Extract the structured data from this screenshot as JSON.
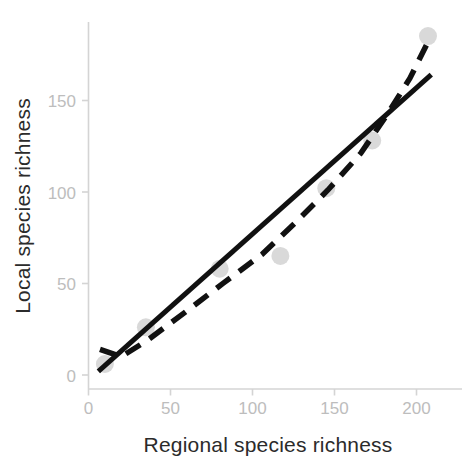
{
  "chart_data": {
    "type": "scatter",
    "title": "",
    "subtitle": "",
    "xlabel": "Regional species richness",
    "ylabel": "Local species richness",
    "xlim": [
      -4,
      222
    ],
    "ylim": [
      -8,
      198
    ],
    "xticks": [
      0,
      50,
      100,
      150,
      200
    ],
    "xtick_labels": [
      "0",
      "50",
      "100",
      "150",
      "200"
    ],
    "yticks": [
      0,
      50,
      100,
      150
    ],
    "ytick_labels": [
      "0",
      "50",
      "100",
      "150"
    ],
    "grid": false,
    "legend": null,
    "points": [
      {
        "x": 10,
        "y": 6
      },
      {
        "x": 35,
        "y": 26
      },
      {
        "x": 80,
        "y": 58
      },
      {
        "x": 117,
        "y": 65
      },
      {
        "x": 145,
        "y": 102
      },
      {
        "x": 173,
        "y": 128
      },
      {
        "x": 207,
        "y": 185
      }
    ],
    "marker": {
      "shape": "circle",
      "color": "#d9d9d9",
      "size_px": 18
    },
    "series": [
      {
        "name": "linear-fit",
        "style": "solid",
        "color": "#111111",
        "points": [
          {
            "x": 6,
            "y": 2
          },
          {
            "x": 209,
            "y": 164
          }
        ]
      },
      {
        "name": "nonlinear-fit",
        "style": "dashed",
        "color": "#111111",
        "points": [
          {
            "x": 7,
            "y": 14
          },
          {
            "x": 20,
            "y": 10
          },
          {
            "x": 36,
            "y": 19
          },
          {
            "x": 60,
            "y": 35
          },
          {
            "x": 82,
            "y": 50
          },
          {
            "x": 106,
            "y": 66
          },
          {
            "x": 126,
            "y": 83
          },
          {
            "x": 146,
            "y": 101
          },
          {
            "x": 166,
            "y": 121
          },
          {
            "x": 182,
            "y": 142
          },
          {
            "x": 196,
            "y": 162
          },
          {
            "x": 206,
            "y": 180
          }
        ]
      }
    ]
  },
  "axis": {
    "x_title": "Regional species richness",
    "y_title": "Local species richness",
    "x_tick_0": "0",
    "x_tick_1": "50",
    "x_tick_2": "100",
    "x_tick_3": "150",
    "x_tick_4": "200",
    "y_tick_0": "0",
    "y_tick_1": "50",
    "y_tick_2": "100",
    "y_tick_3": "150"
  },
  "colors": {
    "marker": "#d9d9d9",
    "line": "#111111",
    "axis": "#d4d4d4",
    "tick_text": "#bdbdbd",
    "title_text": "#2b2b2b",
    "background": "#ffffff"
  }
}
